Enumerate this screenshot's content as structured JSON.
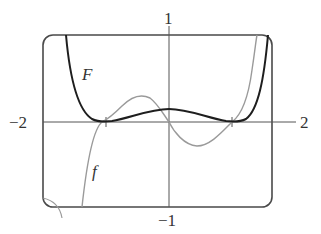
{
  "figure": {
    "labels": {
      "y_top": "1",
      "y_bottom": "−1",
      "x_left": "−2",
      "x_right": "2",
      "curve_F": "F",
      "curve_f": "f"
    },
    "colors": {
      "frame": "#4a4a4a",
      "axes": "#555555",
      "F_curve": "#1e1e1e",
      "f_curve": "#9a9a9a",
      "background": "#ffffff"
    },
    "window": {
      "xmin": -2,
      "xmax": 2,
      "ymin": -1,
      "ymax": 1
    },
    "ticks": {
      "x": [
        -1,
        1
      ]
    }
  }
}
